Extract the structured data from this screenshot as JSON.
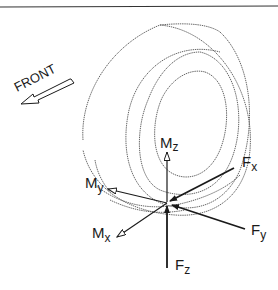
{
  "figure": {
    "direction_label": "FRONT",
    "axes": [
      {
        "id": "Mz",
        "symbol": "M",
        "subscript": "z",
        "type": "moment",
        "direction": "up"
      },
      {
        "id": "Fx",
        "symbol": "F",
        "subscript": "x",
        "type": "force",
        "direction": "toward contact patch from front-right"
      },
      {
        "id": "Fy",
        "symbol": "F",
        "subscript": "y",
        "type": "force",
        "direction": "toward contact patch from right"
      },
      {
        "id": "Fz",
        "symbol": "F",
        "subscript": "z",
        "type": "force",
        "direction": "upward into contact patch"
      },
      {
        "id": "My",
        "symbol": "M",
        "subscript": "y",
        "type": "moment",
        "direction": "left"
      },
      {
        "id": "Mx",
        "symbol": "M",
        "subscript": "x",
        "type": "moment",
        "direction": "down-left"
      }
    ],
    "labels": {
      "Mz": {
        "main": "M",
        "sub": "z"
      },
      "Fx": {
        "main": "F",
        "sub": "x"
      },
      "Fy": {
        "main": "F",
        "sub": "y"
      },
      "Fz": {
        "main": "F",
        "sub": "z"
      },
      "My": {
        "main": "M",
        "sub": "y"
      },
      "Mx": {
        "main": "M",
        "sub": "x"
      }
    },
    "colors": {
      "line": "#1a1a1a",
      "tire_outline": "#555555",
      "background": "#ffffff"
    }
  }
}
